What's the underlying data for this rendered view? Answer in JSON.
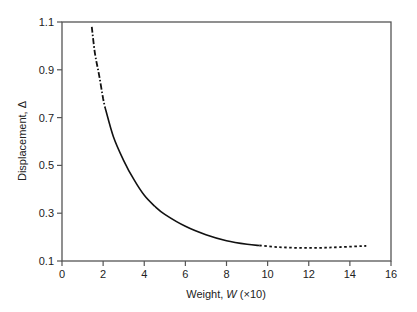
{
  "chart_data": {
    "type": "line",
    "title": "",
    "xlabel": "Weight, W (×10)",
    "xlabel_parts": {
      "prefix": "Weight, ",
      "var": "W",
      "suffix": " (×10)"
    },
    "ylabel": "Displacement, Δ",
    "xlim": [
      0,
      16
    ],
    "ylim": [
      0.1,
      1.1
    ],
    "x_ticks": [
      0,
      2,
      4,
      6,
      8,
      10,
      12,
      14,
      16
    ],
    "x_tick_labels": [
      "0",
      "2",
      "4",
      "6",
      "8",
      "10",
      "12",
      "14",
      "16"
    ],
    "y_ticks": [
      0.1,
      0.3,
      0.5,
      0.7,
      0.9,
      1.1
    ],
    "y_tick_labels": [
      "0.1",
      "0.3",
      "0.5",
      "0.7",
      "0.9",
      "1.1"
    ],
    "grid": false,
    "legend": null,
    "series": [
      {
        "name": "dash-dot segment (extrapolated, low W)",
        "style": "dashdot",
        "x": [
          1.45,
          1.6,
          1.8,
          2.0,
          2.1
        ],
        "y": [
          1.08,
          0.97,
          0.88,
          0.78,
          0.74
        ]
      },
      {
        "name": "solid segment",
        "style": "solid",
        "x": [
          2.1,
          2.5,
          3.0,
          3.5,
          4.0,
          4.5,
          5.0,
          6.0,
          7.0,
          8.0,
          9.0,
          9.6
        ],
        "y": [
          0.74,
          0.62,
          0.52,
          0.44,
          0.375,
          0.33,
          0.295,
          0.245,
          0.21,
          0.185,
          0.17,
          0.165
        ]
      },
      {
        "name": "dotted segment (extrapolated, high W)",
        "style": "dotted",
        "x": [
          9.6,
          10.5,
          11.5,
          12.5,
          13.5,
          14.8
        ],
        "y": [
          0.165,
          0.158,
          0.155,
          0.155,
          0.158,
          0.163
        ]
      }
    ]
  },
  "colors": {
    "axis": "#555555",
    "curve": "#111111",
    "text": "#222222"
  }
}
